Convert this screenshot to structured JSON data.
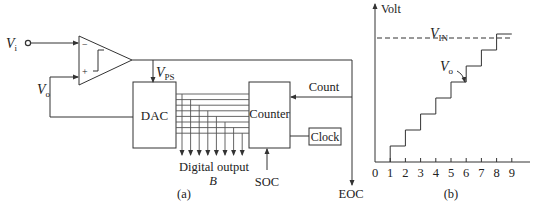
{
  "panel_a": {
    "label": "(a)",
    "input_label_main": "V",
    "input_label_sub": "i",
    "feedback_label_main": "V",
    "feedback_label_sub": "o",
    "comparator": {
      "minus": "−",
      "plus": "+"
    },
    "comparator_output_label_main": "V",
    "comparator_output_label_sub": "PS",
    "dac_label": "DAC",
    "counter_label": "Counter",
    "clock_label": "Clock",
    "count_label": "Count",
    "soc_label": "SOC",
    "eoc_label": "EOC",
    "digital_output_label": "Digital output",
    "digital_output_symbol": "B",
    "bus_lines": 8
  },
  "panel_b": {
    "label": "(b)",
    "y_axis_label": "Volt",
    "vin_label_main": "V",
    "vin_label_sub": "IN",
    "vo_label_main": "V",
    "vo_label_sub": "o",
    "x_ticks": [
      "0",
      "1",
      "2",
      "3",
      "4",
      "5",
      "6",
      "7",
      "8",
      "9"
    ],
    "staircase_steps": [
      {
        "from": 1,
        "to": 2,
        "level": 1
      },
      {
        "from": 2,
        "to": 3,
        "level": 2
      },
      {
        "from": 3,
        "to": 4,
        "level": 3
      },
      {
        "from": 4,
        "to": 5,
        "level": 4
      },
      {
        "from": 5,
        "to": 6,
        "level": 5
      },
      {
        "from": 6,
        "to": 7,
        "level": 6
      },
      {
        "from": 7,
        "to": 8,
        "level": 7
      },
      {
        "from": 8,
        "to": 9,
        "level": 8
      }
    ],
    "vin_level": 7.75
  }
}
